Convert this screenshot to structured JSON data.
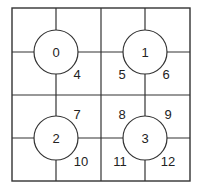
{
  "diagram": {
    "nodes": [
      {
        "id": "node-0",
        "label": "0",
        "cx": 56,
        "cy": 52
      },
      {
        "id": "node-1",
        "label": "1",
        "cx": 145,
        "cy": 52
      },
      {
        "id": "node-2",
        "label": "2",
        "cx": 56,
        "cy": 138
      },
      {
        "id": "node-3",
        "label": "3",
        "cx": 145,
        "cy": 138
      }
    ],
    "cell_labels": [
      {
        "label": "4",
        "x": 77,
        "y": 74
      },
      {
        "label": "5",
        "x": 122,
        "y": 74
      },
      {
        "label": "6",
        "x": 166,
        "y": 74
      },
      {
        "label": "7",
        "x": 77,
        "y": 114
      },
      {
        "label": "8",
        "x": 122,
        "y": 114
      },
      {
        "label": "9",
        "x": 168,
        "y": 114
      },
      {
        "label": "10",
        "x": 81,
        "y": 161
      },
      {
        "label": "11",
        "x": 120,
        "y": 161
      },
      {
        "label": "12",
        "x": 168,
        "y": 161
      }
    ]
  }
}
